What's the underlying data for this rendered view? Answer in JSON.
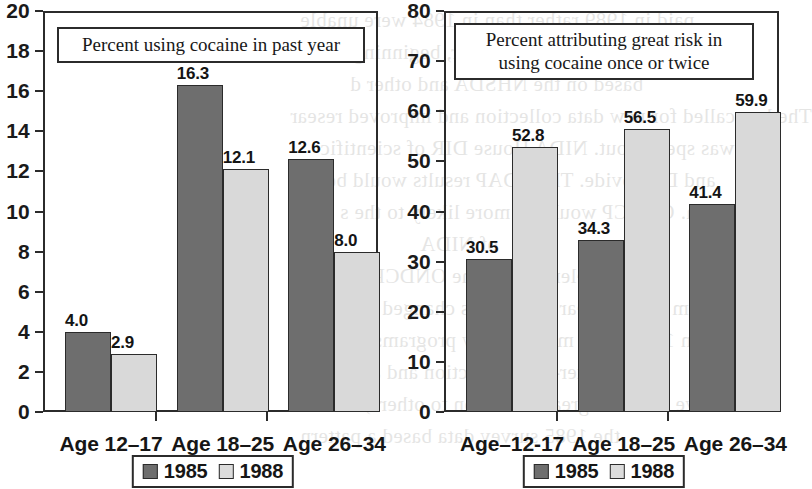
{
  "figure": {
    "legend_labels": [
      "1985",
      "1988"
    ],
    "series_colors": {
      "1985": "#6e6e6e",
      "1988": "#d9d9d9"
    }
  },
  "bleed_text": [
    "paid in 1989 rather than in 1984 were unable",
    "these interviews. However, beginning in",
    "based on the NHSDA and other d",
    "The law called for new data collection and improved resear",
    "it was spelled out. NIDA House DIR of scientific",
    "and D. provide. The ODAP results would be an",
    "data. ONDCP would be more likely to the s",
    "of NIDA",
    "elements of the ONDCP Reports",
    "from a multi-year survey has changed in recent",
    "and in 1980, after multi-survey programs, researc",
    "the after-data collection and analysis",
    "will have caused a great confusion to others; the resu",
    "the 1985 survey data based a pattern"
  ],
  "chart_data": [
    {
      "type": "bar",
      "panel": "left",
      "title": "Percent using cocaine in past year",
      "title_lines": [
        "Percent using cocaine in past year"
      ],
      "categories": [
        "Age 12–17",
        "Age 18–25",
        "Age 26–34"
      ],
      "series": [
        {
          "name": "1985",
          "values": [
            4.0,
            16.3,
            12.6
          ]
        },
        {
          "name": "1988",
          "values": [
            2.9,
            12.1,
            8.0
          ]
        }
      ],
      "value_labels": {
        "1985": [
          "4.0",
          "16.3",
          "12.6"
        ],
        "1988": [
          "2.9",
          "12.1",
          "8.0"
        ]
      },
      "ylim": [
        0,
        20
      ],
      "yticks": [
        0,
        2,
        4,
        6,
        8,
        10,
        12,
        14,
        16,
        18,
        20
      ],
      "ytick_labels": [
        "0",
        "2",
        "4",
        "6",
        "8",
        "10",
        "12",
        "14",
        "16",
        "18",
        "20"
      ],
      "xlabel": "",
      "ylabel": "",
      "grid": false,
      "legend_position": "bottom-center"
    },
    {
      "type": "bar",
      "panel": "right",
      "title": "Percent attributing great risk in using cocaine once or twice",
      "title_lines": [
        "Percent attributing great risk in",
        "using cocaine once or twice"
      ],
      "categories": [
        "Age–12-17",
        "Age 18–25",
        "Age 26–34"
      ],
      "series": [
        {
          "name": "1985",
          "values": [
            30.5,
            34.3,
            41.4
          ]
        },
        {
          "name": "1988",
          "values": [
            52.8,
            56.5,
            59.9
          ]
        }
      ],
      "value_labels": {
        "1985": [
          "30.5",
          "34.3",
          "41.4"
        ],
        "1988": [
          "52.8",
          "56.5",
          "59.9"
        ]
      },
      "ylim": [
        0,
        80
      ],
      "yticks": [
        0,
        10,
        20,
        30,
        40,
        50,
        60,
        70,
        80
      ],
      "ytick_labels": [
        "0",
        "10",
        "20",
        "30",
        "40",
        "50",
        "60",
        "70",
        "80"
      ],
      "xlabel": "",
      "ylabel": "",
      "grid": false,
      "legend_position": "bottom-center"
    }
  ]
}
